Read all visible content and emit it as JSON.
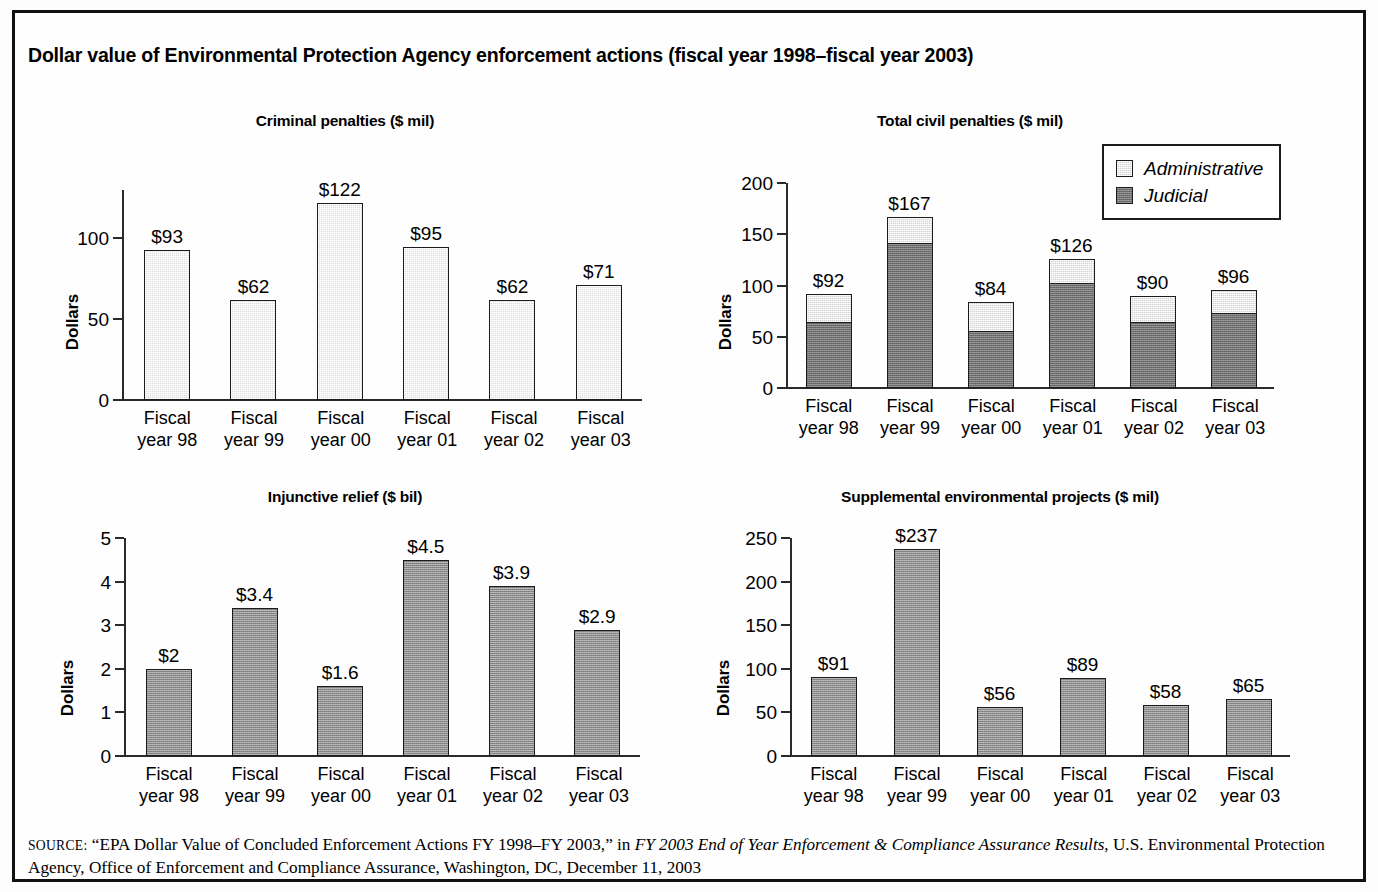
{
  "figure": {
    "title": "Dollar value of Environmental Protection Agency enforcement actions (fiscal year 1998–fiscal year 2003)",
    "categories": [
      "Fiscal\nyear 98",
      "Fiscal\nyear 99",
      "Fiscal\nyear 00",
      "Fiscal\nyear 01",
      "Fiscal\nyear 02",
      "Fiscal\nyear 03"
    ],
    "category_line1": "Fiscal",
    "category_line2": [
      "year 98",
      "year 99",
      "year 00",
      "year 01",
      "year 02",
      "year 03"
    ]
  },
  "legend": {
    "items": [
      {
        "label": "Administrative",
        "color": "#d2d2d2"
      },
      {
        "label": "Judicial",
        "color": "#6f6f6f"
      }
    ]
  },
  "source": {
    "label": "SOURCE:",
    "line1_pre": " “EPA Dollar Value of Concluded Enforcement Actions FY 1998–FY 2003,” in ",
    "line1_italic": "FY 2003 End of Year Enforcement & Compliance Assurance",
    "line2_italic": "Results",
    "line2_post": ", U.S. Environmental Protection Agency, Office of Enforcement and Compliance Assurance, Washington, DC, December 11, 2003"
  },
  "chart_data": [
    {
      "id": "criminal-penalties",
      "type": "bar",
      "title": "Criminal penalties ($ mil)",
      "xlabel": "",
      "ylabel": "Dollars",
      "categories": [
        "Fiscal year 98",
        "Fiscal year 99",
        "Fiscal year 00",
        "Fiscal year 01",
        "Fiscal year 02",
        "Fiscal year 03"
      ],
      "values": [
        93,
        62,
        122,
        95,
        62,
        71
      ],
      "value_labels": [
        "$93",
        "$62",
        "$122",
        "$95",
        "$62",
        "$71"
      ],
      "yticks": [
        0,
        50,
        100
      ],
      "ytick_labels": [
        "0",
        "50",
        "100"
      ],
      "ylim": [
        0,
        130
      ],
      "grid": false,
      "bar_color": "#dcdcdc"
    },
    {
      "id": "total-civil-penalties",
      "type": "bar",
      "stacked": true,
      "title": "Total civil penalties ($ mil)",
      "xlabel": "",
      "ylabel": "Dollars",
      "categories": [
        "Fiscal year 98",
        "Fiscal year 99",
        "Fiscal year 00",
        "Fiscal year 01",
        "Fiscal year 02",
        "Fiscal year 03"
      ],
      "series": [
        {
          "name": "Judicial",
          "values": [
            64,
            142,
            56,
            103,
            65,
            73
          ],
          "color": "#6f6f6f"
        },
        {
          "name": "Administrative",
          "values": [
            28,
            25,
            28,
            23,
            25,
            23
          ],
          "color": "#d2d2d2"
        }
      ],
      "totals": [
        92,
        167,
        84,
        126,
        90,
        96
      ],
      "value_labels": [
        "$92",
        "$167",
        "$84",
        "$126",
        "$90",
        "$96"
      ],
      "yticks": [
        0,
        50,
        100,
        150,
        200
      ],
      "ytick_labels": [
        "0",
        "50",
        "100",
        "150",
        "200"
      ],
      "ylim": [
        0,
        200
      ],
      "grid": false,
      "legend_position": "upper right"
    },
    {
      "id": "injunctive-relief",
      "type": "bar",
      "title": "Injunctive relief ($ bil)",
      "xlabel": "",
      "ylabel": "Dollars",
      "categories": [
        "Fiscal year 98",
        "Fiscal year 99",
        "Fiscal year 00",
        "Fiscal year 01",
        "Fiscal year 02",
        "Fiscal year 03"
      ],
      "values": [
        2,
        3.4,
        1.6,
        4.5,
        3.9,
        2.9
      ],
      "value_labels": [
        "$2",
        "$3.4",
        "$1.6",
        "$4.5",
        "$3.9",
        "$2.9"
      ],
      "yticks": [
        0,
        1,
        2,
        3,
        4,
        5
      ],
      "ytick_labels": [
        "0",
        "1",
        "2",
        "3",
        "4",
        "5"
      ],
      "ylim": [
        0,
        5
      ],
      "grid": false,
      "bar_color": "#8a8a8a"
    },
    {
      "id": "supplemental-environmental-projects",
      "type": "bar",
      "title": "Supplemental environmental projects ($ mil)",
      "xlabel": "",
      "ylabel": "Dollars",
      "categories": [
        "Fiscal year 98",
        "Fiscal year 99",
        "Fiscal year 00",
        "Fiscal year 01",
        "Fiscal year 02",
        "Fiscal year 03"
      ],
      "values": [
        91,
        237,
        56,
        89,
        58,
        65
      ],
      "value_labels": [
        "$91",
        "$237",
        "$56",
        "$89",
        "$58",
        "$65"
      ],
      "yticks": [
        0,
        50,
        100,
        150,
        200,
        250
      ],
      "ytick_labels": [
        "0",
        "50",
        "100",
        "150",
        "200",
        "250"
      ],
      "ylim": [
        0,
        250
      ],
      "grid": false,
      "bar_color": "#8a8a8a"
    }
  ]
}
